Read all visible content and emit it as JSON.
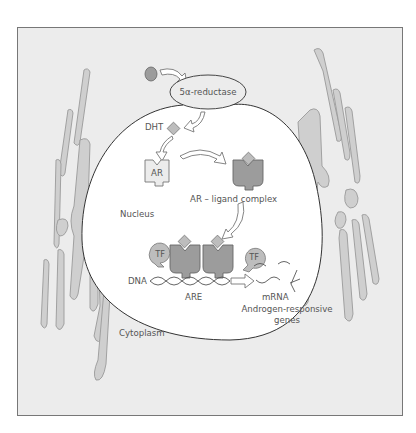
{
  "figure": {
    "frame_fill": "#ececec",
    "frame_stroke": "#777777",
    "nucleus_fill": "#ffffff",
    "organelle_fill": "#cfcfcf",
    "receptor_fill": "#9c9c9c"
  },
  "labels": {
    "enzyme": "5α-reductase",
    "dht": "DHT",
    "ar": "AR",
    "ar_ligand_complex": "AR – ligand complex",
    "nucleus": "Nucleus",
    "tf_left": "TF",
    "tf_right": "TF",
    "dna": "DNA",
    "are": "ARE",
    "mrna": "mRNA",
    "genes_line1": "Androgen-responsive",
    "genes_line2": "genes",
    "cytoplasm": "Cytoplasm"
  }
}
